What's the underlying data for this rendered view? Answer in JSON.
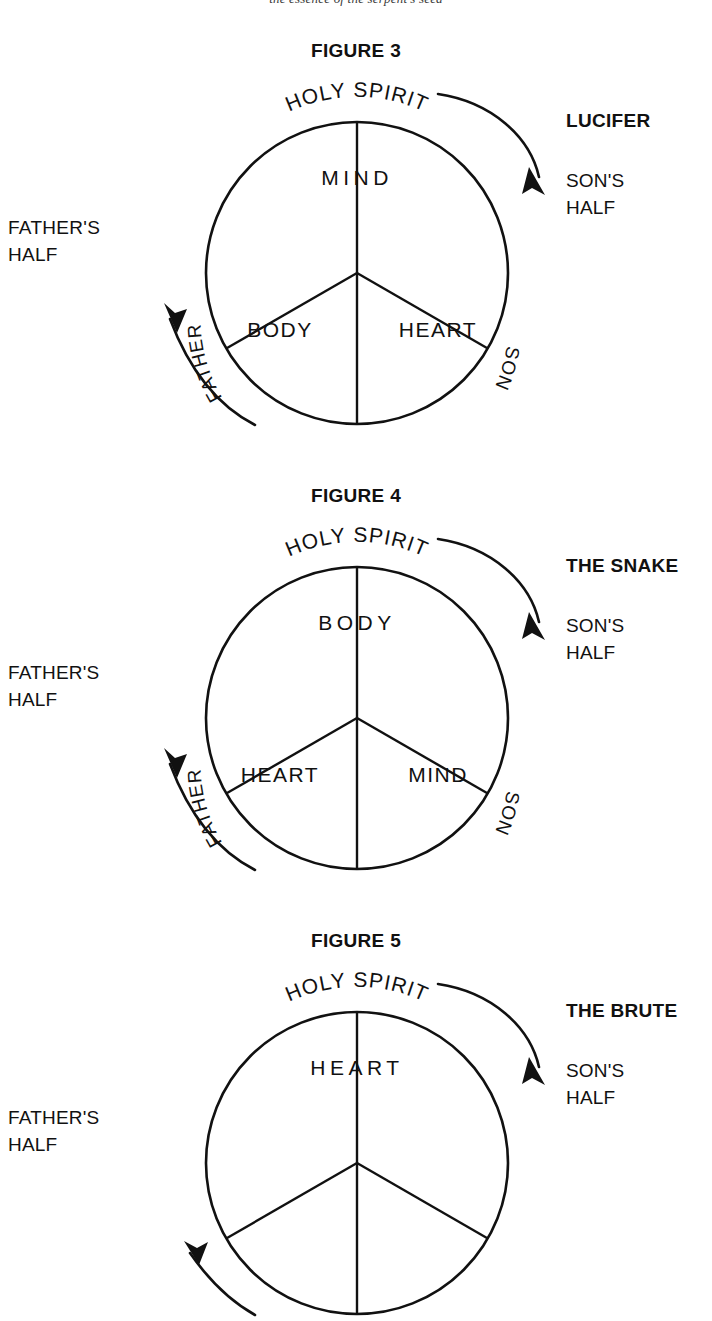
{
  "running_head": "the essence of the serpent's seed",
  "figures": [
    {
      "id": "figure-3",
      "title": "FIGURE 3",
      "top_label": "HOLY  SPIRIT",
      "left_arc_label": "FATHER",
      "right_arc_label": "SON",
      "segments": {
        "top": "MIND",
        "bottom_left": "BODY",
        "bottom_right": "HEART"
      },
      "left_caption": "FATHER'S\nHALF",
      "right_title": "LUCIFER",
      "right_caption": "SON'S\nHALF"
    },
    {
      "id": "figure-4",
      "title": "FIGURE 4",
      "top_label": "HOLY  SPIRIT",
      "left_arc_label": "FATHER",
      "right_arc_label": "SON",
      "segments": {
        "top": "BODY",
        "bottom_left": "HEART",
        "bottom_right": "MIND"
      },
      "left_caption": "FATHER'S\nHALF",
      "right_title": "THE SNAKE",
      "right_caption": "SON'S\nHALF"
    },
    {
      "id": "figure-5",
      "title": "FIGURE 5",
      "top_label": "HOLY  SPIRIT",
      "left_arc_label": "FATHER",
      "right_arc_label": "SON",
      "segments": {
        "top": "HEART",
        "bottom_left": "",
        "bottom_right": ""
      },
      "left_caption": "FATHER'S\nHALF",
      "right_title": "THE BRUTE",
      "right_caption": "SON'S\nHALF"
    }
  ],
  "colors": {
    "ink": "#111111",
    "background": "#ffffff"
  }
}
